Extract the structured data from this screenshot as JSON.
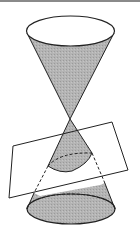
{
  "figure": {
    "colors": {
      "fill": "#b4b4b4",
      "stroke": "#222222",
      "background": "#ffffff",
      "topbar": "#8a8a8a"
    },
    "elements": [
      {
        "name": "upper-nappe",
        "type": "cone"
      },
      {
        "name": "lower-nappe",
        "type": "cone"
      },
      {
        "name": "cutting-plane",
        "type": "parallelogram"
      },
      {
        "name": "conic-section",
        "type": "ellipse"
      }
    ]
  }
}
